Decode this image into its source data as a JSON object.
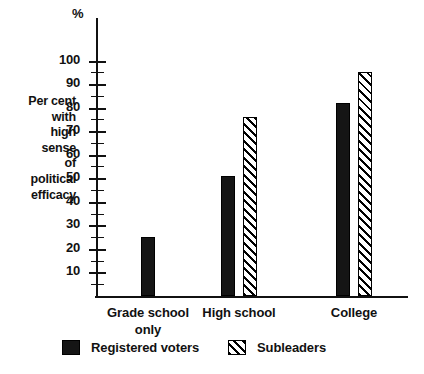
{
  "chart_data": {
    "type": "bar",
    "title": "",
    "subtitle": "",
    "xlabel": "",
    "ylabel": "Per cent with high sense of political efficacy",
    "ylabel_lines": [
      "Per cent",
      "with",
      "high",
      "sense",
      "of",
      "political",
      "efficacy"
    ],
    "unit_symbol": "%",
    "ylim": [
      0,
      100
    ],
    "ytick_step": 10,
    "yticks": [
      10,
      20,
      30,
      40,
      50,
      60,
      70,
      80,
      90,
      100
    ],
    "ytick_labels": [
      "10",
      "20",
      "30",
      "40",
      "50",
      "60",
      "70",
      "80",
      "90",
      "100"
    ],
    "minor_ticks": [
      5,
      15,
      25,
      35,
      45,
      55,
      65,
      75,
      85,
      95
    ],
    "grid": false,
    "legend_position": "bottom",
    "categories": [
      "Grade school only",
      "High school",
      "College"
    ],
    "category_label_lines": [
      [
        "Grade school",
        "only"
      ],
      [
        "High school"
      ],
      [
        "College"
      ]
    ],
    "series": [
      {
        "name": "Registered voters",
        "fill": "solid",
        "color": "#151515",
        "values": [
          25,
          51,
          82
        ]
      },
      {
        "name": "Subleaders",
        "fill": "diagonal-hatch",
        "color": "#000000",
        "values": [
          null,
          76,
          95
        ]
      }
    ]
  },
  "legend": {
    "entries": [
      {
        "label": "Registered voters",
        "swatch": "solid-square-swatch"
      },
      {
        "label": "Subleaders",
        "swatch": "hatched-square-swatch"
      }
    ]
  }
}
